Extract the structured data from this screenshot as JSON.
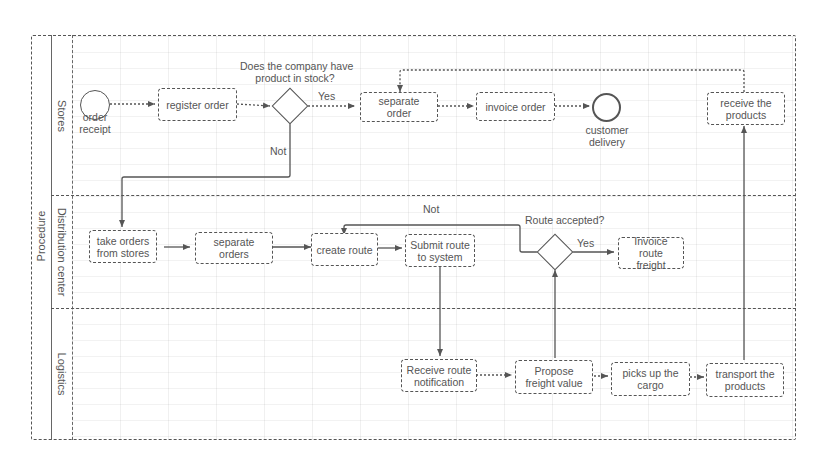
{
  "pool": {
    "label": "Procedure"
  },
  "lanes": [
    {
      "id": "stores",
      "label": "Stores"
    },
    {
      "id": "distribution",
      "label": "Distribution center"
    },
    {
      "id": "logistics",
      "label": "Logistics"
    }
  ],
  "events": {
    "start": {
      "label_line1": "order",
      "label_line2": "receipt"
    },
    "end": {
      "label_line1": "customer",
      "label_line2": "delivery"
    }
  },
  "tasks": {
    "register_order": "register order",
    "separate_order": "separate order",
    "invoice_order": "invoice order",
    "receive_products": "receive the products",
    "take_orders": "take orders from stores",
    "separate_orders": "separate orders",
    "create_route": "create route",
    "submit_route": "Submit route to system",
    "invoice_route_freight": "Invoice route freight",
    "receive_route_notification": "Receive route notification",
    "propose_freight_value": "Propose freight value",
    "picks_up_cargo": "picks up the cargo",
    "transport_products": "transport the products"
  },
  "gateways": {
    "stock": {
      "question_line1": "Does the company have",
      "question_line2": "product in stock?",
      "yes": "Yes",
      "no": "Not"
    },
    "route": {
      "question": "Route accepted?",
      "yes": "Yes",
      "no": "Not"
    }
  },
  "colors": {
    "stroke": "#555555",
    "text": "#555555",
    "background": "#ffffff"
  }
}
